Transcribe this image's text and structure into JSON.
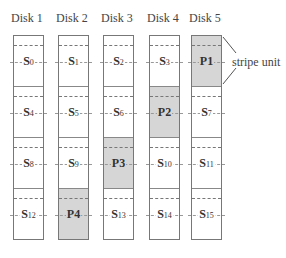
{
  "disks": [
    {
      "label": "Disk 1",
      "units": [
        {
          "name": "S",
          "idx": "0",
          "parity": false
        },
        {
          "name": "S",
          "idx": "4",
          "parity": false
        },
        {
          "name": "S",
          "idx": "8",
          "parity": false
        },
        {
          "name": "S",
          "idx": "12",
          "parity": false
        }
      ]
    },
    {
      "label": "Disk 2",
      "units": [
        {
          "name": "S",
          "idx": "1",
          "parity": false
        },
        {
          "name": "S",
          "idx": "5",
          "parity": false
        },
        {
          "name": "S",
          "idx": "9",
          "parity": false
        },
        {
          "name": "P4",
          "idx": "",
          "parity": true
        }
      ]
    },
    {
      "label": "Disk 3",
      "units": [
        {
          "name": "S",
          "idx": "2",
          "parity": false
        },
        {
          "name": "S",
          "idx": "6",
          "parity": false
        },
        {
          "name": "P3",
          "idx": "",
          "parity": true
        },
        {
          "name": "S",
          "idx": "13",
          "parity": false
        }
      ]
    },
    {
      "label": "Disk 4",
      "units": [
        {
          "name": "S",
          "idx": "3",
          "parity": false
        },
        {
          "name": "P2",
          "idx": "",
          "parity": true
        },
        {
          "name": "S",
          "idx": "10",
          "parity": false
        },
        {
          "name": "S",
          "idx": "14",
          "parity": false
        }
      ]
    },
    {
      "label": "Disk 5",
      "units": [
        {
          "name": "P1",
          "idx": "",
          "parity": true
        },
        {
          "name": "S",
          "idx": "7",
          "parity": false
        },
        {
          "name": "S",
          "idx": "11",
          "parity": false
        },
        {
          "name": "S",
          "idx": "15",
          "parity": false
        }
      ]
    }
  ],
  "annotation": {
    "label": "stripe unit"
  },
  "colors": {
    "parity_fill": "#d6d6d6",
    "data_fill": "#ffffff",
    "border": "#777777"
  }
}
